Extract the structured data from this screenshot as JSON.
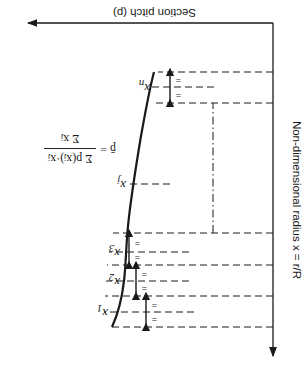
{
  "diagram": {
    "orientation": "rotated 180 degrees (upside-down)",
    "horizontal_axis": {
      "label": "Section pitch (p)",
      "arrow": "right"
    },
    "vertical_axis": {
      "label": "Non-dimensional radius x = r/R",
      "arrow": "up"
    },
    "stations": [
      {
        "id": "x1",
        "label": "x",
        "sub": "1"
      },
      {
        "id": "x2",
        "label": "x",
        "sub": "2"
      },
      {
        "id": "x3",
        "label": "x",
        "sub": "3"
      },
      {
        "id": "xj",
        "label": "x",
        "sub": "j"
      },
      {
        "id": "xn",
        "label": "x",
        "sub": "n"
      }
    ],
    "equal_mark": "=",
    "formula": {
      "lhs": "p̄ =",
      "numerator": "Σ p(xⱼ)·xⱼ",
      "denominator": "Σ xⱼ",
      "sum_limits": {
        "lower": "1",
        "upper": "n"
      }
    },
    "colors": {
      "ink": "#1a1a1a",
      "background": "#ffffff"
    }
  }
}
